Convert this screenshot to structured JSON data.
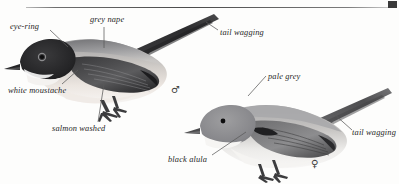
{
  "plate": {
    "background_color": "#fdfdfc",
    "rule_color": "#4a4a4a",
    "corner_mark_color": "#3a3a3a"
  },
  "annotations": [
    {
      "id": "eye-ring",
      "text": "eye-ring",
      "x": 10,
      "y": 22
    },
    {
      "id": "grey-nape",
      "text": "grey nape",
      "x": 90,
      "y": 15
    },
    {
      "id": "tail-wagging-male",
      "text": "tail wagging",
      "x": 220,
      "y": 28
    },
    {
      "id": "white-moustache",
      "text": "white moustache",
      "x": 8,
      "y": 86
    },
    {
      "id": "salmon-washed",
      "text": "salmon washed",
      "x": 52,
      "y": 124
    },
    {
      "id": "pale-grey",
      "text": "pale grey",
      "x": 268,
      "y": 72
    },
    {
      "id": "black-alula",
      "text": "black alula",
      "x": 168,
      "y": 155
    },
    {
      "id": "tail-wagging-female",
      "text": "tail wagging",
      "x": 350,
      "y": 128
    }
  ],
  "symbols": {
    "male_label": "♂",
    "male_x": 171,
    "male_y": 84,
    "female_label": "♀",
    "female_x": 311,
    "female_y": 158
  },
  "subjects": [
    {
      "id": "male-bird",
      "name": "male-warbler-illustration",
      "sex": "male",
      "plumage": {
        "crown": "black",
        "nape": "grey",
        "mantle": "dark grey",
        "wing": "blackish with pale fringes",
        "underparts": "salmon washed white",
        "moustache": "white",
        "eye_ring": "pale",
        "tail": "long, blackish"
      }
    },
    {
      "id": "female-bird",
      "name": "female-warbler-illustration",
      "sex": "female",
      "plumage": {
        "crown": "pale grey",
        "mantle": "pale grey",
        "wing": "grey-brown with black alula",
        "underparts": "whitish",
        "tail": "long, grey-brown"
      }
    }
  ],
  "colors": {
    "ink": "#262626",
    "leader": "#555555",
    "black_plumage": "#2b2b2b",
    "dark_grey_plumage": "#555557",
    "mid_grey_plumage": "#8d8d90",
    "pale_grey_plumage": "#b9b9bb",
    "salmon_wash": "#e8e2de",
    "white_plumage": "#f5f4f2"
  }
}
